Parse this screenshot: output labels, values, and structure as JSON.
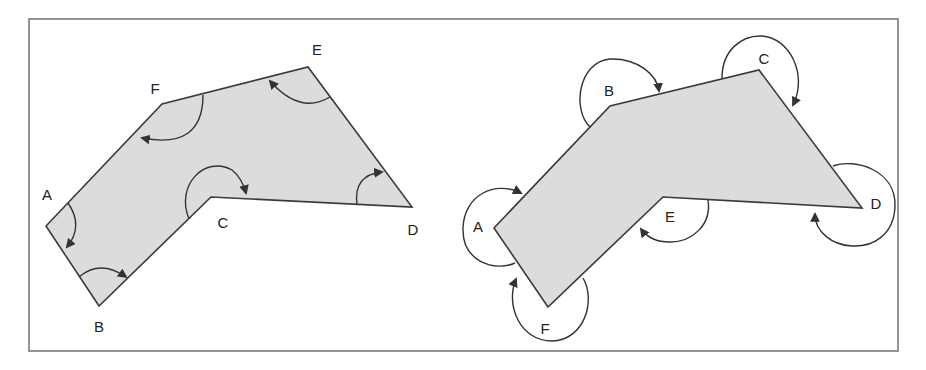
{
  "colors": {
    "background": "#ffffff",
    "frame": "#7a7a7a",
    "polygon_fill": "#dcdcdc",
    "polygon_stroke": "#3a3a3a",
    "arrow": "#333333",
    "label": "#222222"
  },
  "panels": [
    {
      "id": "left",
      "description": "Interior angles traversed in one direction",
      "vertices": [
        {
          "label": "A",
          "x": 46,
          "y": 226,
          "label_x": 47,
          "label_y": 196
        },
        {
          "label": "B",
          "x": 99,
          "y": 306,
          "label_x": 99,
          "label_y": 328
        },
        {
          "label": "C",
          "x": 211,
          "y": 197,
          "label_x": 223,
          "label_y": 224
        },
        {
          "label": "D",
          "x": 412,
          "y": 207,
          "label_x": 413,
          "label_y": 231
        },
        {
          "label": "E",
          "x": 308,
          "y": 67,
          "label_x": 317,
          "label_y": 51
        },
        {
          "label": "F",
          "x": 162,
          "y": 104,
          "label_x": 155,
          "label_y": 90
        }
      ]
    },
    {
      "id": "right",
      "description": "Exterior angles traversed around the polygon",
      "vertices": [
        {
          "label": "A",
          "x": 494,
          "y": 228,
          "label_x": 478,
          "label_y": 228
        },
        {
          "label": "B",
          "x": 610,
          "y": 106,
          "label_x": 609,
          "label_y": 92
        },
        {
          "label": "C",
          "x": 759,
          "y": 70,
          "label_x": 764,
          "label_y": 60
        },
        {
          "label": "D",
          "x": 862,
          "y": 208,
          "label_x": 876,
          "label_y": 205
        },
        {
          "label": "E",
          "x": 663,
          "y": 197,
          "label_x": 670,
          "label_y": 218
        },
        {
          "label": "F",
          "x": 548,
          "y": 307,
          "label_x": 545,
          "label_y": 330
        }
      ]
    }
  ]
}
